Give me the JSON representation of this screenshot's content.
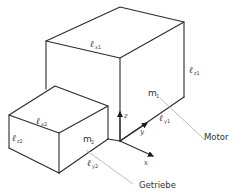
{
  "diagram": {
    "title": "",
    "components": [
      {
        "id": "motor",
        "name": "Motor",
        "mass_symbol": "m",
        "mass_index": "1",
        "dimensions": {
          "x": {
            "symbol": "ℓ",
            "sub": "x1"
          },
          "y": {
            "symbol": "ℓ",
            "sub": "y1"
          },
          "z": {
            "symbol": "ℓ",
            "sub": "z1"
          }
        }
      },
      {
        "id": "getriebe",
        "name": "Getriebe",
        "mass_symbol": "m",
        "mass_index": "2",
        "dimensions": {
          "x": {
            "symbol": "ℓ",
            "sub": "x2"
          },
          "y": {
            "symbol": "ℓ",
            "sub": "y2"
          },
          "z": {
            "symbol": "ℓ",
            "sub": "z2"
          }
        }
      }
    ],
    "axes": {
      "x": "x",
      "y": "y",
      "z": "z"
    },
    "colors": {
      "edge": "#2a2a2a",
      "leader": "#bdbdbd",
      "text": "#333333"
    }
  }
}
